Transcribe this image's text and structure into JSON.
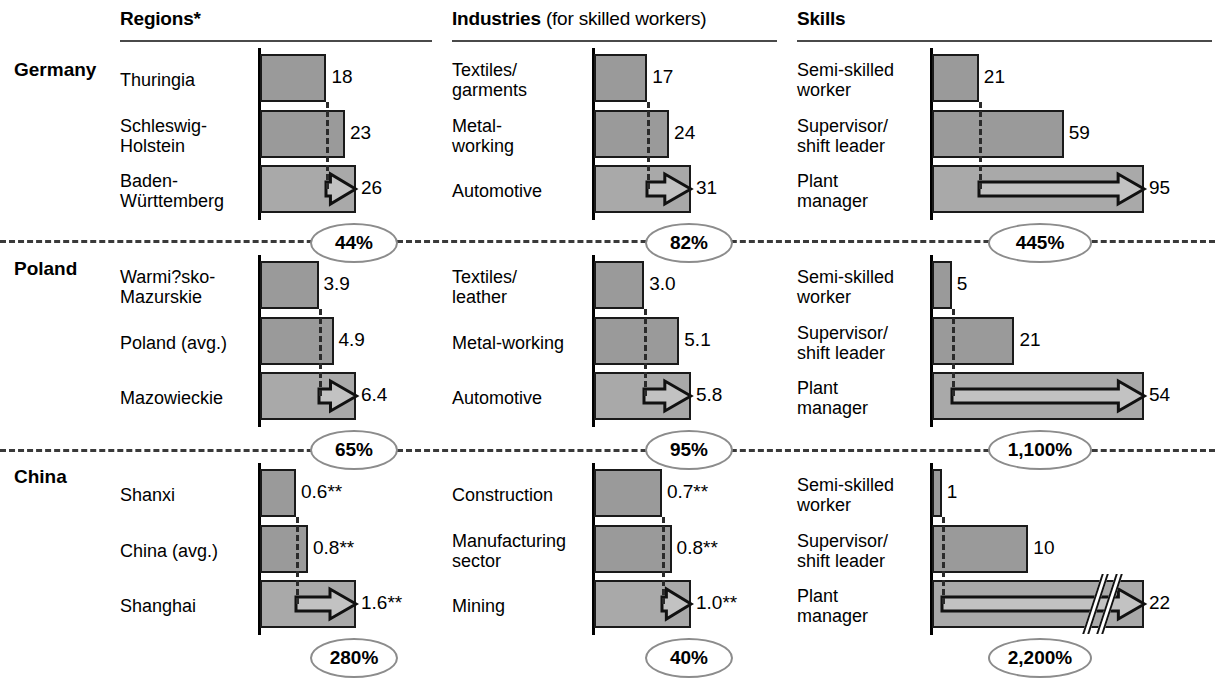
{
  "columns": [
    {
      "id": "regions",
      "title": "Regions*",
      "subtitle": ""
    },
    {
      "id": "industries",
      "title": "Industries",
      "subtitle": " (for skilled workers)"
    },
    {
      "id": "skills",
      "title": "Skills",
      "subtitle": ""
    }
  ],
  "countries": [
    "Germany",
    "Poland",
    "China"
  ],
  "chart_data": {
    "type": "bar",
    "orientation": "horizontal",
    "grid": false,
    "legend": null,
    "notes": [
      "*",
      "**"
    ],
    "panels": [
      {
        "country": "Germany",
        "column": "Regions*",
        "categories": [
          "Thuringia",
          "Schleswig-\nHolstein",
          "Baden-\nWürttemberg"
        ],
        "values": [
          18,
          23,
          26
        ],
        "value_labels": [
          "18",
          "23",
          "26"
        ],
        "reference_index": 0,
        "arrow_on_index": 2,
        "spread_label": "44%"
      },
      {
        "country": "Germany",
        "column": "Industries",
        "categories": [
          "Textiles/\ngarments",
          "Metal-\nworking",
          "Automotive"
        ],
        "values": [
          17,
          24,
          31
        ],
        "value_labels": [
          "17",
          "24",
          "31"
        ],
        "reference_index": 0,
        "arrow_on_index": 2,
        "spread_label": "82%"
      },
      {
        "country": "Germany",
        "column": "Skills",
        "categories": [
          "Semi-skilled\nworker",
          "Supervisor/\nshift leader",
          "Plant\nmanager"
        ],
        "values": [
          21,
          59,
          95
        ],
        "value_labels": [
          "21",
          "59",
          "95"
        ],
        "reference_index": 0,
        "arrow_on_index": 2,
        "spread_label": "445%"
      },
      {
        "country": "Poland",
        "column": "Regions*",
        "categories": [
          "Warmi?sko-\nMazurskie",
          "Poland (avg.)",
          "Mazowieckie"
        ],
        "values": [
          3.9,
          4.9,
          6.4
        ],
        "value_labels": [
          "3.9",
          "4.9",
          "6.4"
        ],
        "reference_index": 0,
        "arrow_on_index": 2,
        "spread_label": "65%"
      },
      {
        "country": "Poland",
        "column": "Industries",
        "categories": [
          "Textiles/\nleather",
          "Metal-working",
          "Automotive"
        ],
        "values": [
          3.0,
          5.1,
          5.8
        ],
        "value_labels": [
          "3.0",
          "5.1",
          "5.8"
        ],
        "reference_index": 0,
        "arrow_on_index": 2,
        "spread_label": "95%"
      },
      {
        "country": "Poland",
        "column": "Skills",
        "categories": [
          "Semi-skilled\nworker",
          "Supervisor/\nshift leader",
          "Plant\nmanager"
        ],
        "values": [
          5,
          21,
          54
        ],
        "value_labels": [
          "5",
          "21",
          "54"
        ],
        "reference_index": 0,
        "arrow_on_index": 2,
        "spread_label": "1,100%"
      },
      {
        "country": "China",
        "column": "Regions*",
        "categories": [
          "Shanxi",
          "China (avg.)",
          "Shanghai"
        ],
        "values": [
          0.6,
          0.8,
          1.6
        ],
        "value_labels": [
          "0.6**",
          "0.8**",
          "1.6**"
        ],
        "reference_index": 0,
        "arrow_on_index": 2,
        "spread_label": "280%"
      },
      {
        "country": "China",
        "column": "Industries",
        "categories": [
          "Construction",
          "Manufacturing\nsector",
          "Mining"
        ],
        "values": [
          0.7,
          0.8,
          1.0
        ],
        "value_labels": [
          "0.7**",
          "0.8**",
          "1.0**"
        ],
        "reference_index": 0,
        "arrow_on_index": 2,
        "spread_label": "40%"
      },
      {
        "country": "China",
        "column": "Skills",
        "categories": [
          "Semi-skilled\nworker",
          "Supervisor/\nshift leader",
          "Plant\nmanager"
        ],
        "values": [
          1,
          10,
          22
        ],
        "value_labels": [
          "1",
          "10",
          "22"
        ],
        "reference_index": 0,
        "arrow_on_index": 2,
        "axis_break_on_index": 2,
        "spread_label": "2,200%"
      }
    ]
  }
}
